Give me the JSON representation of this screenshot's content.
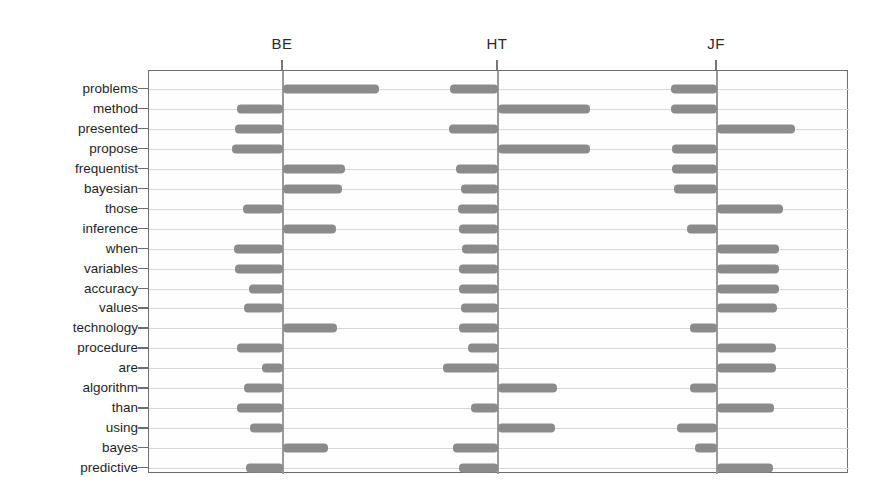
{
  "chart_data": {
    "type": "bar",
    "title": "",
    "subtitle": "",
    "xlabel": "",
    "ylabel": "",
    "orientation": "horizontal",
    "grid": true,
    "legend_position": "none",
    "panels": [
      "BE",
      "HT",
      "JF"
    ],
    "categories": [
      "problems",
      "method",
      "presented",
      "propose",
      "frequentist",
      "bayesian",
      "those",
      "inference",
      "when",
      "variables",
      "accuracy",
      "values",
      "technology",
      "procedure",
      "are",
      "algorithm",
      "than",
      "using",
      "bayes",
      "predictive"
    ],
    "series": [
      {
        "name": "BE",
        "values": [
          3.2,
          -1.55,
          -1.6,
          -1.7,
          2.05,
          1.95,
          -1.35,
          1.75,
          -1.65,
          -1.6,
          -1.15,
          -1.3,
          1.8,
          -1.55,
          -0.7,
          -1.3,
          -1.55,
          -1.1,
          1.5,
          -1.25
        ]
      },
      {
        "name": "HT",
        "values": [
          -1.6,
          3.05,
          -1.65,
          3.05,
          -1.4,
          -1.25,
          -1.35,
          -1.3,
          -1.2,
          -1.3,
          -1.3,
          -1.25,
          -1.3,
          -1.0,
          -1.85,
          1.95,
          -0.9,
          1.9,
          -1.5,
          -1.3
        ]
      },
      {
        "name": "JF",
        "values": [
          -1.55,
          -1.55,
          2.6,
          -1.5,
          -1.5,
          -1.45,
          2.2,
          -1.0,
          2.05,
          2.05,
          2.05,
          2.0,
          -0.9,
          1.95,
          1.95,
          -0.9,
          1.9,
          -1.35,
          -0.75,
          1.85
        ]
      }
    ],
    "xlim": [
      -3.6,
      3.6
    ],
    "x_ticks_visible": false,
    "bar_color": "#8b8b8b",
    "axis_color": "#6e6e6e",
    "grid_color": "#d8d8d8"
  },
  "headers": [
    {
      "label": "BE"
    },
    {
      "label": "HT"
    },
    {
      "label": "JF"
    }
  ],
  "row_labels": [
    {
      "label": "problems"
    },
    {
      "label": "method"
    },
    {
      "label": "presented"
    },
    {
      "label": "propose"
    },
    {
      "label": "frequentist"
    },
    {
      "label": "bayesian"
    },
    {
      "label": "those"
    },
    {
      "label": "inference"
    },
    {
      "label": "when"
    },
    {
      "label": "variables"
    },
    {
      "label": "accuracy"
    },
    {
      "label": "values"
    },
    {
      "label": "technology"
    },
    {
      "label": "procedure"
    },
    {
      "label": "are"
    },
    {
      "label": "algorithm"
    },
    {
      "label": "than"
    },
    {
      "label": "using"
    },
    {
      "label": "bayes"
    },
    {
      "label": "predictive"
    }
  ],
  "geometry": {
    "plot_left": 148,
    "plot_top": 70,
    "plot_right": 848,
    "plot_bottom": 473,
    "row_first_y": 88,
    "row_step": 19.95,
    "axis_x": [
      282,
      497,
      716
    ],
    "unit_px": 30,
    "bar_height": 9,
    "header_y": 45,
    "tick_len": 10
  }
}
